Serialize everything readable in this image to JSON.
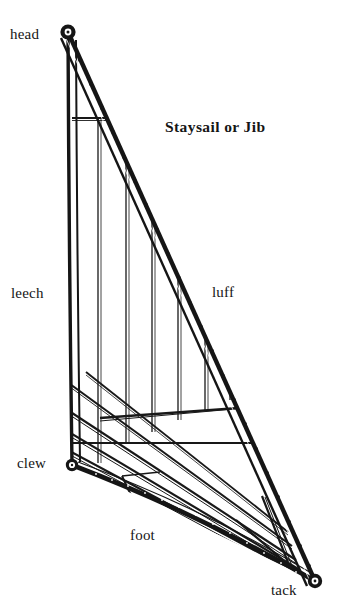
{
  "figure": {
    "title": "Staysail or Jib",
    "background_color": "#ffffff",
    "ink_color": "#151515",
    "labels": [
      {
        "key": "head",
        "text": "head",
        "part": "top corner of the sail"
      },
      {
        "key": "leech",
        "text": "leech",
        "part": "aft vertical edge"
      },
      {
        "key": "luff",
        "text": "luff",
        "part": "forward diagonal edge with hanks"
      },
      {
        "key": "clew",
        "text": "clew",
        "part": "lower aft corner"
      },
      {
        "key": "foot",
        "text": "foot",
        "part": "bottom edge"
      },
      {
        "key": "tack",
        "text": "tack",
        "part": "lower forward corner"
      }
    ],
    "corners": {
      "head": {
        "x": 68,
        "y": 32,
        "grommet": true
      },
      "clew": {
        "x": 72,
        "y": 465,
        "grommet": true
      },
      "tack": {
        "x": 315,
        "y": 581,
        "grommet": true
      }
    },
    "edges": {
      "luff": {
        "from": "head",
        "to": "tack",
        "style": "heavy double band with hank dots",
        "hank_count": 22
      },
      "leech": {
        "from": "head",
        "to": "clew",
        "style": "narrow tabling band, slight roach"
      },
      "foot": {
        "from": "clew",
        "to": "tack",
        "style": "heavy band with stitch dots"
      }
    },
    "panels": {
      "upper_seams": "vertical cloth seams",
      "lower_seams": "diagonal cloth seams parallel to the foot",
      "reinforcements": "corner patches at head, clew and tack"
    }
  }
}
